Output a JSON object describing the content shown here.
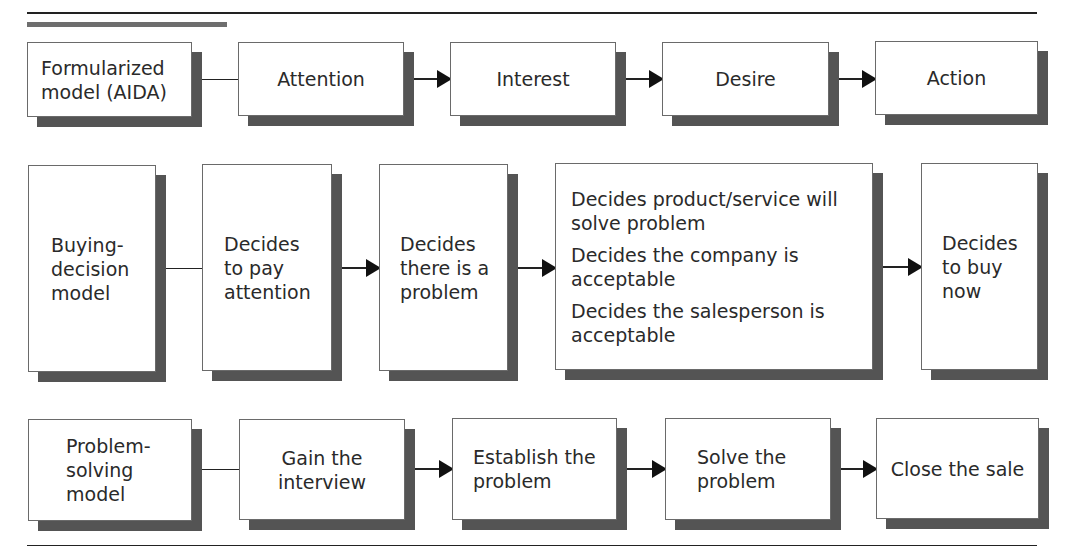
{
  "figure": {
    "accent_color": "#6e6e6e",
    "shadow_color": "#545454",
    "rows": [
      {
        "id": "aida",
        "boxes": [
          {
            "lines": [
              "Formularized",
              "model (AIDA)"
            ]
          },
          {
            "lines": [
              "Attention"
            ]
          },
          {
            "lines": [
              "Interest"
            ]
          },
          {
            "lines": [
              "Desire"
            ]
          },
          {
            "lines": [
              "Action"
            ]
          }
        ]
      },
      {
        "id": "buying-decision",
        "boxes": [
          {
            "lines": [
              "Buying-",
              "decision",
              "model"
            ]
          },
          {
            "lines": [
              "Decides",
              "to pay",
              "attention"
            ]
          },
          {
            "lines": [
              "Decides",
              "there is a",
              "problem"
            ]
          },
          {
            "items": [
              [
                "Decides product/service will",
                "solve problem"
              ],
              [
                "Decides the company is",
                "acceptable"
              ],
              [
                "Decides the salesperson is",
                "acceptable"
              ]
            ]
          },
          {
            "lines": [
              "Decides",
              "to buy",
              "now"
            ]
          }
        ]
      },
      {
        "id": "problem-solving",
        "boxes": [
          {
            "lines": [
              "Problem-",
              "solving",
              "model"
            ]
          },
          {
            "lines": [
              "Gain the",
              "interview"
            ]
          },
          {
            "lines": [
              "Establish the",
              "problem"
            ]
          },
          {
            "lines": [
              "Solve the",
              "problem"
            ]
          },
          {
            "lines": [
              "Close the sale"
            ]
          }
        ]
      }
    ]
  }
}
